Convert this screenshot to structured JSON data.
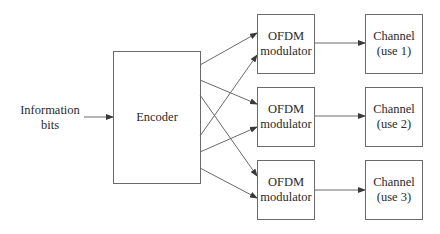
{
  "diagram": {
    "input_label": [
      "Information",
      "bits"
    ],
    "encoder": {
      "label": "Encoder"
    },
    "modulators": [
      {
        "label": [
          "OFDM",
          "modulator"
        ]
      },
      {
        "label": [
          "OFDM",
          "modulator"
        ]
      },
      {
        "label": [
          "OFDM",
          "modulator"
        ]
      }
    ],
    "channels": [
      {
        "label": [
          "Channel",
          "(use 1)"
        ]
      },
      {
        "label": [
          "Channel",
          "(use 2)"
        ]
      },
      {
        "label": [
          "Channel",
          "(use 3)"
        ]
      }
    ],
    "connections": [
      {
        "from": "encoder",
        "to": "modulator-1"
      },
      {
        "from": "encoder",
        "to": "modulator-2"
      },
      {
        "from": "encoder",
        "to": "modulator-3"
      },
      {
        "from": "encoder",
        "to": "modulator-1"
      },
      {
        "from": "encoder",
        "to": "modulator-2"
      },
      {
        "from": "encoder",
        "to": "modulator-3"
      },
      {
        "from": "modulator-1",
        "to": "channel-1"
      },
      {
        "from": "modulator-2",
        "to": "channel-2"
      },
      {
        "from": "modulator-3",
        "to": "channel-3"
      }
    ],
    "colors": {
      "stroke": "#6a6a6a",
      "text": "#2a2a2a",
      "background": "#ffffff"
    }
  }
}
